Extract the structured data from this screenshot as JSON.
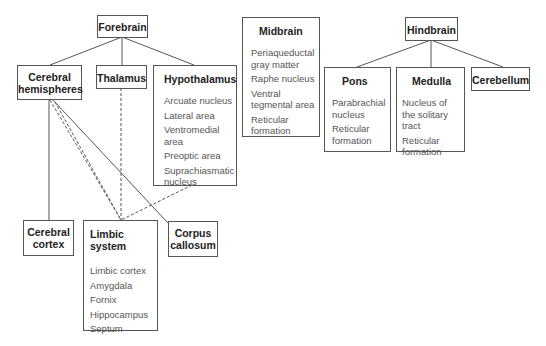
{
  "diagram": {
    "type": "hierarchy",
    "nodes": {
      "forebrain": {
        "title": "Forebrain"
      },
      "cerebral_hemispheres": {
        "title": "Cerebral hemispheres",
        "line1": "Cerebral",
        "line2": "hemispheres"
      },
      "thalamus": {
        "title": "Thalamus"
      },
      "hypothalamus": {
        "title": "Hypothalamus",
        "items": [
          "Arcuate nucleus",
          "Lateral area",
          "Ventromedial area",
          "Preoptic area",
          "Suprachiasmatic nucleus"
        ]
      },
      "midbrain": {
        "title": "Midbrain",
        "items": [
          "Periaqueductal gray matter",
          "Raphe nucleus",
          "Ventral tegmental area",
          "Reticular formation"
        ]
      },
      "hindbrain": {
        "title": "Hindbrain"
      },
      "pons": {
        "title": "Pons",
        "items": [
          "Parabrachial nucleus",
          "Reticular formation"
        ]
      },
      "medulla": {
        "title": "Medulla",
        "items": [
          "Nucleus of the solitary tract",
          "Reticular formation"
        ]
      },
      "cerebellum": {
        "title": "Cerebellum"
      },
      "cerebral_cortex": {
        "title": "Cerebral cortex",
        "line1": "Cerebral",
        "line2": "cortex"
      },
      "limbic_system": {
        "title": "Limbic system",
        "items": [
          "Limbic cortex",
          "Amygdala",
          "Fornix",
          "Hippocampus",
          "Septum"
        ]
      },
      "corpus_callosum": {
        "title": "Corpus callosum",
        "line1": "Corpus",
        "line2": "callosum"
      }
    },
    "edges": [
      {
        "from": "Forebrain",
        "to": "Cerebral hemispheres",
        "style": "solid"
      },
      {
        "from": "Forebrain",
        "to": "Thalamus",
        "style": "solid"
      },
      {
        "from": "Forebrain",
        "to": "Hypothalamus",
        "style": "solid"
      },
      {
        "from": "Cerebral hemispheres",
        "to": "Cerebral cortex",
        "style": "solid"
      },
      {
        "from": "Cerebral hemispheres",
        "to": "Corpus callosum",
        "style": "solid"
      },
      {
        "from": "Cerebral hemispheres",
        "to": "Limbic system",
        "style": "dashed"
      },
      {
        "from": "Thalamus",
        "to": "Limbic system",
        "style": "dashed"
      },
      {
        "from": "Hypothalamus",
        "to": "Limbic system",
        "style": "dashed"
      },
      {
        "from": "Hindbrain",
        "to": "Pons",
        "style": "solid"
      },
      {
        "from": "Hindbrain",
        "to": "Medulla",
        "style": "solid"
      },
      {
        "from": "Hindbrain",
        "to": "Cerebellum",
        "style": "solid"
      }
    ]
  }
}
